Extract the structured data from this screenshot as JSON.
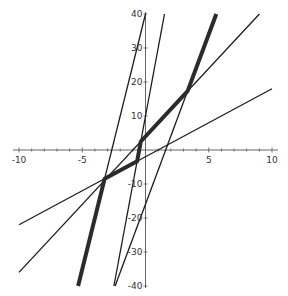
{
  "chart_data": {
    "type": "line",
    "title": "",
    "xlabel": "",
    "ylabel": "",
    "xlim": [
      -10,
      10
    ],
    "ylim": [
      -40,
      40
    ],
    "grid": false,
    "legend": "none",
    "x_ticks": [
      -10,
      -5,
      5,
      10
    ],
    "x_tick_labels": [
      "-10",
      "-5",
      "5",
      "10"
    ],
    "y_ticks": [
      -40,
      -30,
      -20,
      -10,
      10,
      20,
      30,
      40
    ],
    "y_tick_labels": [
      "-40",
      "-30",
      "-20",
      "-10",
      "10",
      "20",
      "30",
      "40"
    ],
    "x_minor_step": 1,
    "y_minor_step": 10,
    "series": [
      {
        "name": "y = 2x - 2",
        "style": "thin",
        "slope": 2,
        "intercept": -2,
        "x": [
          -10,
          10
        ],
        "y": [
          -22,
          18
        ]
      },
      {
        "name": "y = 4x + 4",
        "style": "thin",
        "slope": 4,
        "intercept": 4,
        "x": [
          -10,
          9
        ],
        "y": [
          -36,
          40
        ]
      },
      {
        "name": "y = 15x + 40",
        "style": "thin",
        "slope": 15,
        "intercept": 40,
        "x": [
          -3.23,
          0
        ],
        "y": [
          -8.46,
          40
        ]
      },
      {
        "name": "y = 20x + 10",
        "style": "thin",
        "slope": 20,
        "intercept": 10,
        "x": [
          -2.5,
          1.5
        ],
        "y": [
          -40,
          40
        ]
      },
      {
        "name": "y = 10x - 16",
        "style": "thin",
        "slope": 10,
        "intercept": -16,
        "x": [
          -2.4,
          3.33
        ],
        "y": [
          -40,
          17.33
        ]
      },
      {
        "name": "piecewise envelope",
        "style": "thick",
        "x": [
          -5.33,
          -3.23,
          -0.667,
          -0.375,
          3.33,
          5.6
        ],
        "y": [
          -40,
          -8.46,
          -3.33,
          2.5,
          17.33,
          40
        ]
      }
    ]
  }
}
